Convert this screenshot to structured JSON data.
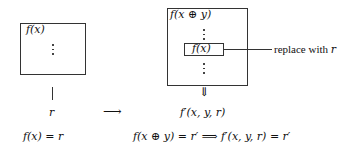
{
  "diagram": {
    "left": {
      "box_label": "f(x)",
      "result_symbol": "r",
      "equation": "f(x) = r"
    },
    "transition_arrow": "⟶",
    "right": {
      "outer_box_label": "f(x ⊕ y)",
      "inner_box_label": "f(x)",
      "annotation_prefix": "replace with ",
      "annotation_symbol": "r",
      "down_arrow": "⇓",
      "result_expression": "f′(x, y, r)",
      "equation_left": "f(x ⊕ y) = r′",
      "implies": "⟹",
      "equation_right": "f′(x, y, r) = r′"
    }
  }
}
